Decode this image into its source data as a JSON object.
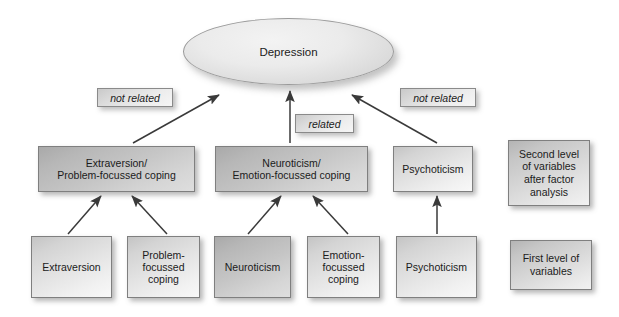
{
  "diagram": {
    "type": "hierarchical-path-diagram",
    "root": {
      "id": "depression",
      "label": "Depression",
      "shape": "ellipse"
    },
    "second_level": [
      {
        "id": "extraversion-problem",
        "label": "Extraversion/\nProblem-focussed coping"
      },
      {
        "id": "neuroticism-emotion",
        "label": "Neuroticism/\nEmotion-focussed coping"
      },
      {
        "id": "psychoticism-2",
        "label": "Psychoticism"
      }
    ],
    "first_level": [
      {
        "id": "extraversion",
        "label": "Extraversion"
      },
      {
        "id": "problem-focussed",
        "label": "Problem-\nfocussed\ncoping"
      },
      {
        "id": "neuroticism",
        "label": "Neuroticism"
      },
      {
        "id": "emotion-focussed",
        "label": "Emotion-\nfocussed\ncoping"
      },
      {
        "id": "psychoticism-1",
        "label": "Psychoticism"
      }
    ],
    "edge_labels": [
      {
        "id": "not-related-left",
        "label": "not related"
      },
      {
        "id": "related-center",
        "label": "related"
      },
      {
        "id": "not-related-right",
        "label": "not related"
      }
    ],
    "legend": [
      {
        "id": "legend-second-level",
        "label": "Second level\nof variables\nafter factor\nanalysis"
      },
      {
        "id": "legend-first-level",
        "label": "First level of\nvariables"
      }
    ],
    "colors": {
      "node_border": "#7f7f7f",
      "node_fill_light": "#e4e4e4",
      "node_fill_dark": "#c6c6c6",
      "edge_stroke": "#3a3a3a",
      "text": "#1b1b1b",
      "background": "#ffffff"
    }
  }
}
